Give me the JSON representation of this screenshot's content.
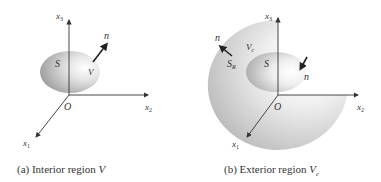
{
  "panels": [
    {
      "id": "a",
      "caption_prefix": "(a) Interior region ",
      "caption_var": "V",
      "labels": {
        "x3": "x",
        "x3_sub": "3",
        "x2": "x",
        "x2_sub": "2",
        "x1": "x",
        "x1_sub": "1",
        "origin": "O",
        "surface": "S",
        "region": "V",
        "normal": "n"
      }
    },
    {
      "id": "b",
      "caption_prefix": "(b) Exterior region ",
      "caption_var": "V",
      "caption_var_sub": "c",
      "labels": {
        "x3": "x",
        "x3_sub": "3",
        "x2": "x",
        "x2_sub": "2",
        "x1": "x",
        "x1_sub": "1",
        "origin": "O",
        "surface": "S",
        "outer_surface": "S",
        "outer_surface_sub": "R",
        "region": "V",
        "region_sub": "c",
        "normal_outer": "n",
        "normal_inner": "n"
      }
    }
  ],
  "colors": {
    "axis": "#333333",
    "shade_dark": "#9a9a9a",
    "shade_light": "#ffffff"
  }
}
